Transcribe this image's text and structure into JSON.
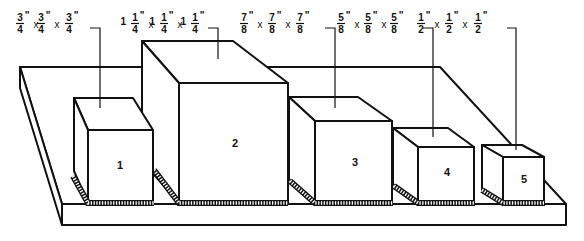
{
  "parts": [
    {
      "id": "1",
      "label": "1",
      "dimension": {
        "whole": "",
        "num": "3",
        "den": "4",
        "unit": "\""
      },
      "text": "3/4\" x 3/4\" x 3/4\""
    },
    {
      "id": "2",
      "label": "2",
      "dimension": {
        "whole": "1",
        "num": "1",
        "den": "4",
        "unit": "\""
      },
      "text": "1 1/4\" x 1 1/4\" x 1 1/4\""
    },
    {
      "id": "3",
      "label": "3",
      "dimension": {
        "whole": "",
        "num": "7",
        "den": "8",
        "unit": "\""
      },
      "text": "7/8\" x 7/8\" x 7/8\""
    },
    {
      "id": "4",
      "label": "4",
      "dimension": {
        "whole": "",
        "num": "5",
        "den": "8",
        "unit": "\""
      },
      "text": "5/8\" x 5/8\" x 5/8\""
    },
    {
      "id": "5",
      "label": "5",
      "dimension": {
        "whole": "",
        "num": "1",
        "den": "2",
        "unit": "\""
      },
      "text": "1/2\" x 1/2\" x 1/2\""
    }
  ],
  "times_symbol": "x",
  "colors": {
    "ink": "#111111",
    "paper": "#ffffff"
  }
}
